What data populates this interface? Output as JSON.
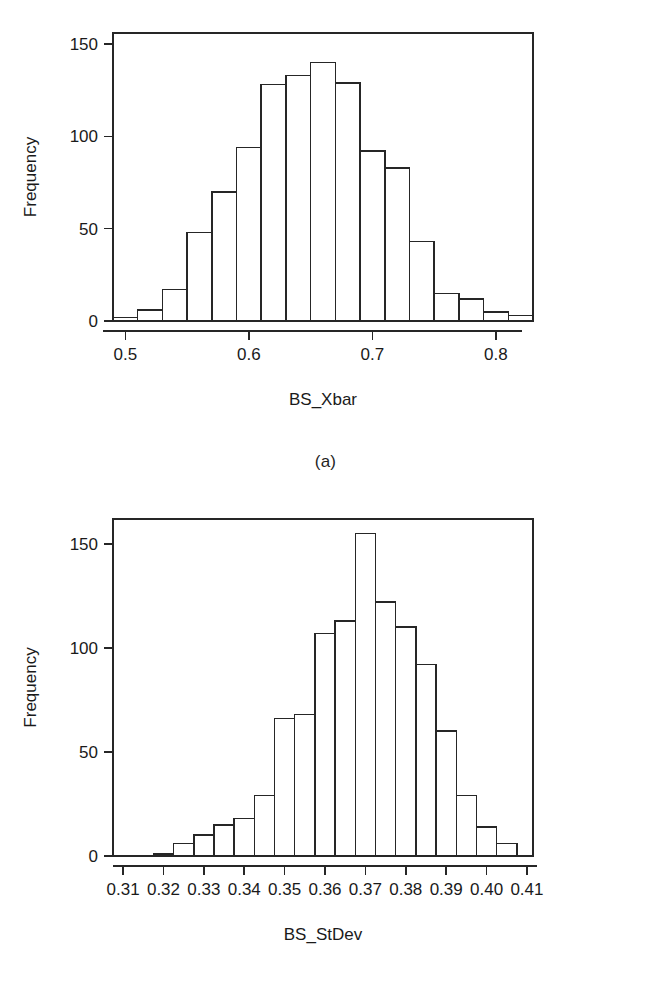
{
  "figures": [
    {
      "id": "a",
      "caption": "(a)",
      "chart": {
        "type": "bar",
        "title": "",
        "subtitle": "",
        "xlabel": "BS_Xbar",
        "ylabel": "Frequency",
        "grid": false,
        "legend": null,
        "xlim": [
          0.49,
          0.83
        ],
        "ylim": [
          0,
          156
        ],
        "xticks": [
          0.5,
          0.6,
          0.7,
          0.8
        ],
        "xtick_labels": [
          "0.5",
          "0.6",
          "0.7",
          "0.8"
        ],
        "yticks": [
          0,
          50,
          100,
          150
        ],
        "ytick_labels": [
          "0",
          "50",
          "100",
          "150"
        ],
        "bin_width": 0.02,
        "bin_edges": [
          0.49,
          0.51,
          0.53,
          0.55,
          0.57,
          0.59,
          0.61,
          0.63,
          0.65,
          0.67,
          0.69,
          0.71,
          0.73,
          0.75,
          0.77,
          0.79,
          0.81,
          0.83
        ],
        "categories": [
          "0.49-0.51",
          "0.51-0.53",
          "0.53-0.55",
          "0.55-0.57",
          "0.57-0.59",
          "0.59-0.61",
          "0.61-0.63",
          "0.63-0.65",
          "0.65-0.67",
          "0.67-0.69",
          "0.69-0.71",
          "0.71-0.73",
          "0.73-0.75",
          "0.75-0.77",
          "0.77-0.79",
          "0.79-0.81",
          "0.81-0.83"
        ],
        "values": [
          2,
          6,
          17,
          48,
          70,
          94,
          128,
          133,
          140,
          129,
          92,
          83,
          43,
          15,
          12,
          5,
          3
        ]
      }
    },
    {
      "id": "b",
      "caption": "(b)",
      "chart": {
        "type": "bar",
        "title": "",
        "subtitle": "",
        "xlabel": "BS_StDev",
        "ylabel": "Frequency",
        "grid": false,
        "legend": null,
        "xlim": [
          0.3075,
          0.4115
        ],
        "ylim": [
          0,
          162
        ],
        "xticks": [
          0.31,
          0.32,
          0.33,
          0.34,
          0.35,
          0.36,
          0.37,
          0.38,
          0.39,
          0.4,
          0.41
        ],
        "xtick_labels": [
          "0.31",
          "0.32",
          "0.33",
          "0.34",
          "0.35",
          "0.36",
          "0.37",
          "0.38",
          "0.39",
          "0.40",
          "0.41"
        ],
        "yticks": [
          0,
          50,
          100,
          150
        ],
        "ytick_labels": [
          "0",
          "50",
          "100",
          "150"
        ],
        "bin_width": 0.005,
        "bin_edges": [
          0.3175,
          0.3225,
          0.3275,
          0.3325,
          0.3375,
          0.3425,
          0.3475,
          0.3525,
          0.3575,
          0.3625,
          0.3675,
          0.3725,
          0.3775,
          0.3825,
          0.3875,
          0.3925,
          0.3975,
          0.4025,
          0.4075
        ],
        "categories": [
          "0.3175-0.3225",
          "0.3225-0.3275",
          "0.3275-0.3325",
          "0.3325-0.3375",
          "0.3375-0.3425",
          "0.3425-0.3475",
          "0.3475-0.3525",
          "0.3525-0.3575",
          "0.3575-0.3625",
          "0.3625-0.3675",
          "0.3675-0.3725",
          "0.3725-0.3775",
          "0.3775-0.3825",
          "0.3825-0.3875",
          "0.3875-0.3925",
          "0.3925-0.3975",
          "0.3975-0.4025",
          "0.4025-0.4075"
        ],
        "values": [
          1,
          6,
          10,
          15,
          18,
          29,
          66,
          68,
          107,
          113,
          155,
          122,
          110,
          92,
          60,
          29,
          14,
          6
        ]
      }
    }
  ],
  "style": {
    "stroke_color": "#262626",
    "text_color": "#1a1a1a",
    "background": "#ffffff"
  }
}
